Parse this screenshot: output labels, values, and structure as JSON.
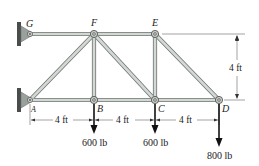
{
  "diagram": {
    "type": "truss",
    "nodes": {
      "G": {
        "label": "G",
        "x": 30,
        "y": 34
      },
      "F": {
        "label": "F",
        "x": 94,
        "y": 34
      },
      "E": {
        "label": "E",
        "x": 155,
        "y": 34
      },
      "A": {
        "label": "A",
        "x": 30,
        "y": 100
      },
      "B": {
        "label": "B",
        "x": 94,
        "y": 100
      },
      "C": {
        "label": "C",
        "x": 155,
        "y": 100
      },
      "D": {
        "label": "D",
        "x": 219,
        "y": 100
      }
    },
    "members": [
      [
        "G",
        "F"
      ],
      [
        "F",
        "E"
      ],
      [
        "A",
        "B"
      ],
      [
        "B",
        "C"
      ],
      [
        "C",
        "D"
      ],
      [
        "A",
        "F"
      ],
      [
        "F",
        "B"
      ],
      [
        "F",
        "C"
      ],
      [
        "E",
        "C"
      ],
      [
        "E",
        "D"
      ]
    ],
    "supports": [
      {
        "node": "G",
        "type": "pin-wall"
      },
      {
        "node": "A",
        "type": "pin-wall"
      }
    ],
    "dimensions": {
      "height": "4 ft",
      "spans": [
        "4 ft",
        "4 ft",
        "4 ft"
      ]
    },
    "loads": [
      {
        "node": "B",
        "label": "600 lb"
      },
      {
        "node": "C",
        "label": "600 lb"
      },
      {
        "node": "D",
        "label": "800 lb"
      }
    ],
    "colors": {
      "member_fill": "#c9cfcb",
      "member_edge": "#6f7672",
      "support": "#9aa09c",
      "wall": "#4a4d4b",
      "ink": "#222222"
    }
  }
}
